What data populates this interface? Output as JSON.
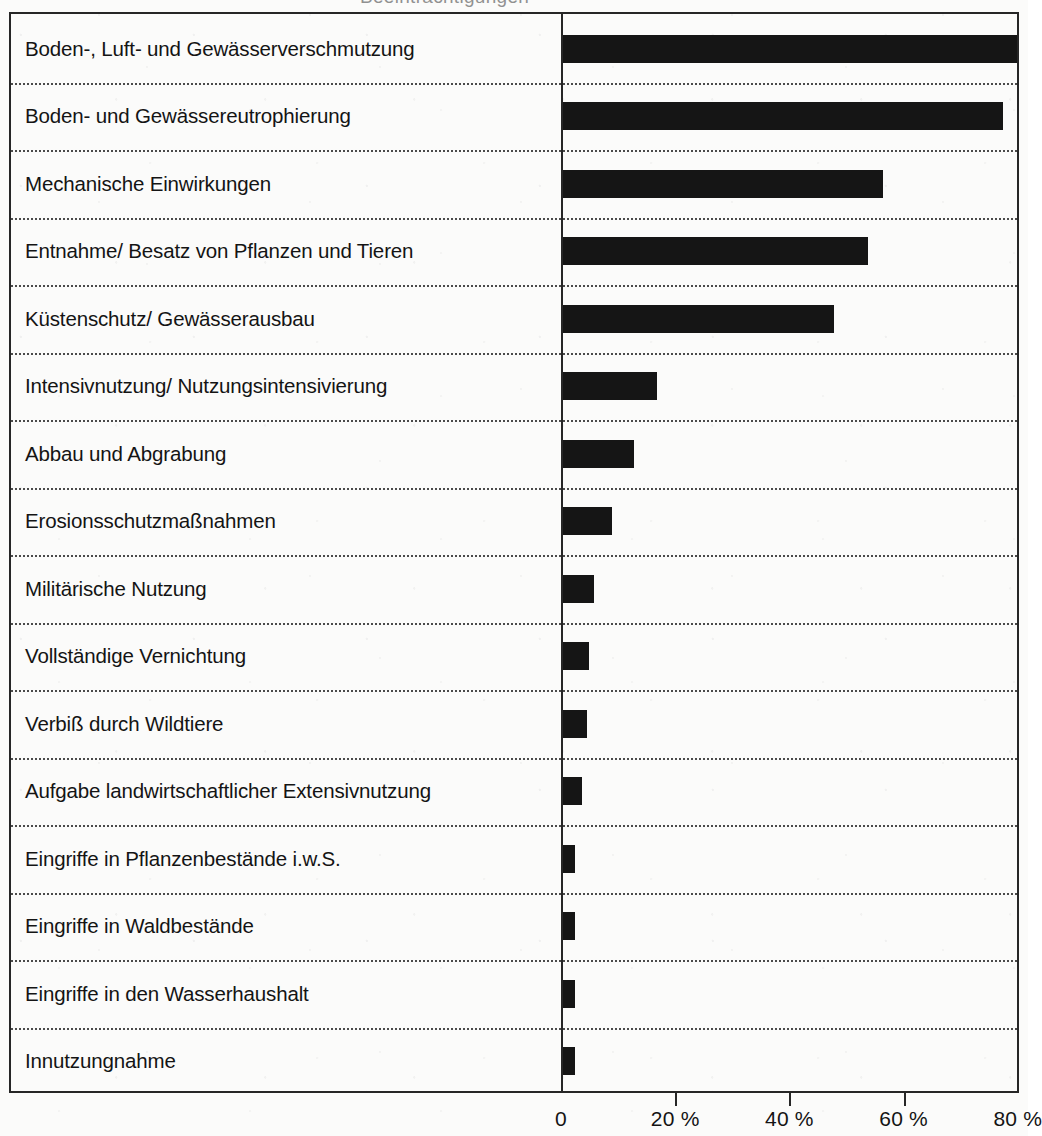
{
  "page": {
    "background_color": "#fbfbfa",
    "ink_color": "#151515",
    "cropped_title_remnant": "Beeinträchtigungen"
  },
  "chart_data": {
    "type": "bar",
    "orientation": "horizontal",
    "title": "",
    "subtitle": "",
    "xlabel": "",
    "ylabel": "",
    "xlim": [
      0,
      80
    ],
    "grid": false,
    "legend": null,
    "bar_color": "#151515",
    "categories": [
      "Boden-, Luft- und Gewässerverschmutzung",
      "Boden- und Gewässereutrophierung",
      "Mechanische Einwirkungen",
      "Entnahme/ Besatz von Pflanzen und Tieren",
      "Küstenschutz/ Gewässerausbau",
      "Intensivnutzung/ Nutzungsintensivierung",
      "Abbau und Abgrabung",
      "Erosionsschutzmaßnahmen",
      "Militärische Nutzung",
      "Vollständige Vernichtung",
      "Verbiß durch Wildtiere",
      "Aufgabe landwirtschaftlicher Extensivnutzung",
      "Eingriffe in Pflanzenbestände i.w.S.",
      "Eingriffe in Waldbestände",
      "Eingriffe in den Wasserhaushalt",
      "Innutzungnahme"
    ],
    "values": [
      79.5,
      77,
      56,
      53.5,
      47.5,
      16.5,
      12.5,
      8.5,
      5.5,
      4.5,
      4.2,
      3.3,
      2.1,
      2.1,
      2.1,
      2.1
    ],
    "xticks": [
      0,
      20,
      40,
      60,
      80
    ],
    "xticklabels": [
      "0",
      "20 %",
      "40 %",
      "60 %",
      "80 %"
    ]
  }
}
